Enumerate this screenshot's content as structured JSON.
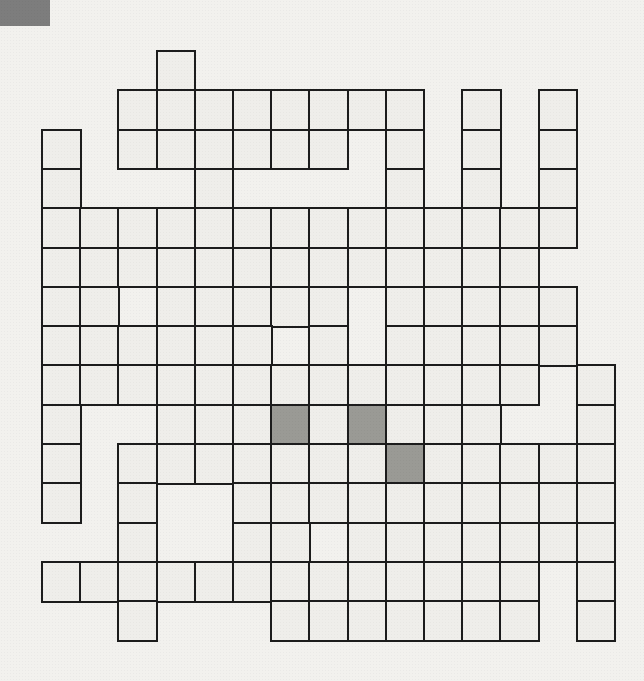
{
  "page": {
    "kind": "crossword-puzzle-grid",
    "width": 644,
    "height": 681,
    "background_color": "#f2f1ee"
  },
  "corner_mark": {
    "name": "corner-mark",
    "x": 0,
    "y": 0,
    "width": 50,
    "height": 26,
    "color": "#7d7d7d"
  },
  "grid": {
    "columns": 15,
    "rows": 15,
    "origin_x": 41,
    "origin_y": 50,
    "cell_width": 38.2,
    "cell_height": 39.3,
    "line_color": "#1c1c1c",
    "line_width": 2.5,
    "cell_fill": "#efeeea",
    "shaded_fill": "#9a9a95",
    "shaded_cells": [
      [
        9,
        6
      ],
      [
        9,
        8
      ],
      [
        10,
        9
      ]
    ],
    "filled_map": [
      "___________________________",
      "0 0 0 1 0 0 0 0 0 0 0 0 0 0 0",
      "0 0 1 1 1 1 1 1 1 1 0 1 0 1 0",
      "1 0 1 1 1 1 1 1 0 1 0 1 0 1 0",
      "1 0 0 0 1 0 0 0 0 1 0 1 0 1 0",
      "1 1 1 1 1 1 1 1 1 1 1 1 1 1 0",
      "1 1 1 1 1 1 1 1 1 1 1 1 1 0 0",
      "1 1 0 1 1 1 1 1 0 1 1 1 1 1 0",
      "1 1 1 1 1 1 0 1 0 1 1 1 1 1 0",
      "1 1 1 1 1 1 1 1 1 1 1 1 1 0 1",
      "1 0 0 1 1 1 1 1 1 1 1 1 0 0 1",
      "1 0 1 1 1 1 1 1 1 1 1 1 1 1 1",
      "1 0 1 0 0 1 1 1 1 1 1 1 1 1 1",
      "0 0 1 0 0 1 1 1 1 1 1 1 1 0 1",
      "1 1 1 1 1 1 1 1 1 1 1 1 1 0 1",
      "0 0 1 0 0 0 1 1 1 1 1 1 1 0 1"
    ],
    "cells": [
      {
        "c": 3,
        "r": 0
      },
      {
        "c": 2,
        "r": 1
      },
      {
        "c": 3,
        "r": 1
      },
      {
        "c": 4,
        "r": 1
      },
      {
        "c": 5,
        "r": 1
      },
      {
        "c": 6,
        "r": 1
      },
      {
        "c": 7,
        "r": 1
      },
      {
        "c": 8,
        "r": 1
      },
      {
        "c": 9,
        "r": 1
      },
      {
        "c": 11,
        "r": 1
      },
      {
        "c": 13,
        "r": 1
      },
      {
        "c": 0,
        "r": 2
      },
      {
        "c": 2,
        "r": 2
      },
      {
        "c": 3,
        "r": 2
      },
      {
        "c": 4,
        "r": 2
      },
      {
        "c": 5,
        "r": 2
      },
      {
        "c": 6,
        "r": 2
      },
      {
        "c": 7,
        "r": 2
      },
      {
        "c": 9,
        "r": 2
      },
      {
        "c": 11,
        "r": 2
      },
      {
        "c": 13,
        "r": 2
      },
      {
        "c": 0,
        "r": 3
      },
      {
        "c": 4,
        "r": 3
      },
      {
        "c": 9,
        "r": 3
      },
      {
        "c": 11,
        "r": 3
      },
      {
        "c": 13,
        "r": 3
      },
      {
        "c": 0,
        "r": 4
      },
      {
        "c": 1,
        "r": 4
      },
      {
        "c": 2,
        "r": 4
      },
      {
        "c": 3,
        "r": 4
      },
      {
        "c": 4,
        "r": 4
      },
      {
        "c": 5,
        "r": 4
      },
      {
        "c": 6,
        "r": 4
      },
      {
        "c": 7,
        "r": 4
      },
      {
        "c": 8,
        "r": 4
      },
      {
        "c": 9,
        "r": 4
      },
      {
        "c": 10,
        "r": 4
      },
      {
        "c": 11,
        "r": 4
      },
      {
        "c": 12,
        "r": 4
      },
      {
        "c": 13,
        "r": 4
      },
      {
        "c": 0,
        "r": 5
      },
      {
        "c": 1,
        "r": 5
      },
      {
        "c": 2,
        "r": 5
      },
      {
        "c": 3,
        "r": 5
      },
      {
        "c": 4,
        "r": 5
      },
      {
        "c": 5,
        "r": 5
      },
      {
        "c": 6,
        "r": 5
      },
      {
        "c": 7,
        "r": 5
      },
      {
        "c": 8,
        "r": 5
      },
      {
        "c": 9,
        "r": 5
      },
      {
        "c": 10,
        "r": 5
      },
      {
        "c": 11,
        "r": 5
      },
      {
        "c": 12,
        "r": 5
      },
      {
        "c": 0,
        "r": 6
      },
      {
        "c": 1,
        "r": 6
      },
      {
        "c": 3,
        "r": 6
      },
      {
        "c": 4,
        "r": 6
      },
      {
        "c": 5,
        "r": 6
      },
      {
        "c": 6,
        "r": 6
      },
      {
        "c": 7,
        "r": 6
      },
      {
        "c": 9,
        "r": 6
      },
      {
        "c": 10,
        "r": 6
      },
      {
        "c": 11,
        "r": 6
      },
      {
        "c": 12,
        "r": 6
      },
      {
        "c": 13,
        "r": 6
      },
      {
        "c": 0,
        "r": 7
      },
      {
        "c": 1,
        "r": 7
      },
      {
        "c": 2,
        "r": 7
      },
      {
        "c": 3,
        "r": 7
      },
      {
        "c": 4,
        "r": 7
      },
      {
        "c": 5,
        "r": 7
      },
      {
        "c": 7,
        "r": 7
      },
      {
        "c": 9,
        "r": 7
      },
      {
        "c": 10,
        "r": 7
      },
      {
        "c": 11,
        "r": 7
      },
      {
        "c": 12,
        "r": 7
      },
      {
        "c": 13,
        "r": 7
      },
      {
        "c": 0,
        "r": 8
      },
      {
        "c": 1,
        "r": 8
      },
      {
        "c": 2,
        "r": 8
      },
      {
        "c": 3,
        "r": 8
      },
      {
        "c": 4,
        "r": 8
      },
      {
        "c": 5,
        "r": 8
      },
      {
        "c": 6,
        "r": 8
      },
      {
        "c": 7,
        "r": 8
      },
      {
        "c": 8,
        "r": 8
      },
      {
        "c": 9,
        "r": 8
      },
      {
        "c": 10,
        "r": 8
      },
      {
        "c": 11,
        "r": 8
      },
      {
        "c": 12,
        "r": 8
      },
      {
        "c": 14,
        "r": 8
      },
      {
        "c": 0,
        "r": 9
      },
      {
        "c": 3,
        "r": 9
      },
      {
        "c": 4,
        "r": 9
      },
      {
        "c": 5,
        "r": 9
      },
      {
        "c": 6,
        "r": 9
      },
      {
        "c": 7,
        "r": 9
      },
      {
        "c": 8,
        "r": 9
      },
      {
        "c": 9,
        "r": 9
      },
      {
        "c": 10,
        "r": 9
      },
      {
        "c": 11,
        "r": 9
      },
      {
        "c": 14,
        "r": 9
      },
      {
        "c": 0,
        "r": 10
      },
      {
        "c": 2,
        "r": 10
      },
      {
        "c": 3,
        "r": 10
      },
      {
        "c": 4,
        "r": 10
      },
      {
        "c": 5,
        "r": 10
      },
      {
        "c": 6,
        "r": 10
      },
      {
        "c": 7,
        "r": 10
      },
      {
        "c": 8,
        "r": 10
      },
      {
        "c": 9,
        "r": 10
      },
      {
        "c": 10,
        "r": 10
      },
      {
        "c": 11,
        "r": 10
      },
      {
        "c": 12,
        "r": 10
      },
      {
        "c": 13,
        "r": 10
      },
      {
        "c": 14,
        "r": 10
      },
      {
        "c": 0,
        "r": 11
      },
      {
        "c": 2,
        "r": 11
      },
      {
        "c": 5,
        "r": 11
      },
      {
        "c": 6,
        "r": 11
      },
      {
        "c": 7,
        "r": 11
      },
      {
        "c": 8,
        "r": 11
      },
      {
        "c": 9,
        "r": 11
      },
      {
        "c": 10,
        "r": 11
      },
      {
        "c": 11,
        "r": 11
      },
      {
        "c": 12,
        "r": 11
      },
      {
        "c": 13,
        "r": 11
      },
      {
        "c": 14,
        "r": 11
      },
      {
        "c": 2,
        "r": 12
      },
      {
        "c": 5,
        "r": 12
      },
      {
        "c": 6,
        "r": 12
      },
      {
        "c": 8,
        "r": 12
      },
      {
        "c": 9,
        "r": 12
      },
      {
        "c": 10,
        "r": 12
      },
      {
        "c": 11,
        "r": 12
      },
      {
        "c": 12,
        "r": 12
      },
      {
        "c": 13,
        "r": 12
      },
      {
        "c": 14,
        "r": 12
      },
      {
        "c": 0,
        "r": 13
      },
      {
        "c": 1,
        "r": 13
      },
      {
        "c": 2,
        "r": 13
      },
      {
        "c": 3,
        "r": 13
      },
      {
        "c": 4,
        "r": 13
      },
      {
        "c": 5,
        "r": 13
      },
      {
        "c": 6,
        "r": 13
      },
      {
        "c": 7,
        "r": 13
      },
      {
        "c": 8,
        "r": 13
      },
      {
        "c": 9,
        "r": 13
      },
      {
        "c": 10,
        "r": 13
      },
      {
        "c": 11,
        "r": 13
      },
      {
        "c": 12,
        "r": 13
      },
      {
        "c": 14,
        "r": 13
      },
      {
        "c": 2,
        "r": 14
      },
      {
        "c": 6,
        "r": 14
      },
      {
        "c": 7,
        "r": 14
      },
      {
        "c": 8,
        "r": 14
      },
      {
        "c": 9,
        "r": 14
      },
      {
        "c": 10,
        "r": 14
      },
      {
        "c": 11,
        "r": 14
      },
      {
        "c": 12,
        "r": 14
      },
      {
        "c": 14,
        "r": 14
      }
    ]
  }
}
